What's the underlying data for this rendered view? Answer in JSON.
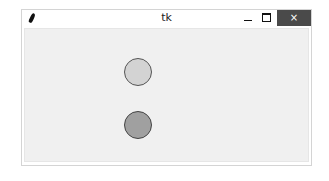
{
  "window": {
    "title": "tk",
    "controls": {
      "minimize": "minimize",
      "maximize": "maximize",
      "close": "×"
    }
  },
  "canvas": {
    "background": "#f0f0f0",
    "circles": [
      {
        "name": "light-circle",
        "fill": "#d3d3d3",
        "outline": "#555555",
        "cx": 137,
        "cy": 71,
        "r": 14
      },
      {
        "name": "dark-circle",
        "fill": "#a0a0a0",
        "outline": "#444444",
        "cx": 137,
        "cy": 124,
        "r": 14
      }
    ]
  }
}
